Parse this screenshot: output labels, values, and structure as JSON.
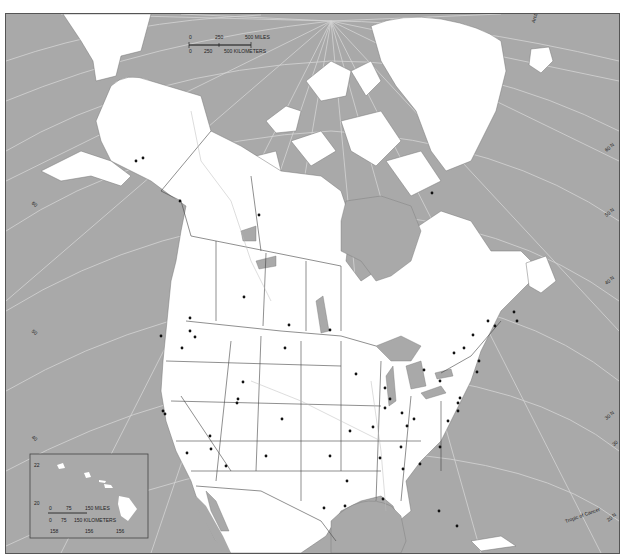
{
  "map": {
    "title": "North America outline map",
    "colors": {
      "water": "#a9a9a9",
      "land": "#ffffff",
      "border": "#555555",
      "graticule": "#d4d4d4",
      "city": "#111111",
      "frame": "#555555"
    },
    "scale_bar": {
      "miles_labels": [
        "0",
        "250",
        "500 MILES"
      ],
      "km_labels": [
        "0",
        "250",
        "500 KILOMETERS"
      ]
    },
    "inset": {
      "name": "Hawaii",
      "lat_labels": [
        "22",
        "20"
      ],
      "lon_labels": [
        "158",
        "156",
        "156"
      ],
      "scale_bar": {
        "miles_labels": [
          "0",
          "75",
          "150 MILES"
        ],
        "km_labels": [
          "0",
          "75",
          "150 KILOMETERS"
        ]
      }
    },
    "graticule_labels": {
      "arctic_circle": "Arctic Circle",
      "tropic_of_cancer": "Tropic of Cancer",
      "lat_right": [
        "60 N",
        "50 N",
        "40 N",
        "30 N",
        "20 N",
        "30"
      ],
      "lat_left": [
        "60",
        "50",
        "40"
      ],
      "lon_bottom": [
        "130",
        "100",
        "80 W",
        "75"
      ]
    }
  }
}
